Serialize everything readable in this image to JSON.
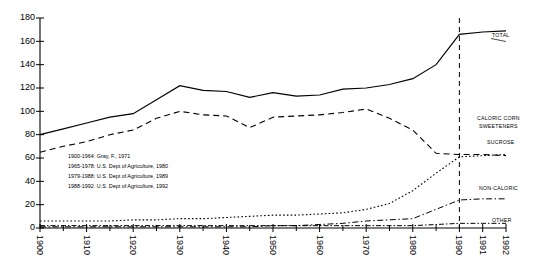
{
  "chart_data": {
    "type": "line",
    "title": "",
    "xlabel": "",
    "ylabel": "",
    "ylim": [
      0,
      180
    ],
    "ytick_step": 20,
    "yticks": [
      0,
      20,
      40,
      60,
      80,
      100,
      120,
      140,
      160,
      180
    ],
    "xticks": [
      1900,
      1910,
      1920,
      1930,
      1940,
      1950,
      1960,
      1970,
      1980,
      1990,
      1991,
      1992
    ],
    "xtick_labels": [
      "1900",
      "1910",
      "1920",
      "1930",
      "1940",
      "1950",
      "1960",
      "1970",
      "1980",
      "1990",
      "1991",
      "1992"
    ],
    "grid": false,
    "legend": "inline-right-labels",
    "x": [
      1900,
      1905,
      1910,
      1915,
      1920,
      1925,
      1930,
      1935,
      1940,
      1945,
      1950,
      1955,
      1960,
      1965,
      1970,
      1975,
      1980,
      1985,
      1990,
      1991,
      1992
    ],
    "series": [
      {
        "name": "TOTAL",
        "style": "solid",
        "values": [
          80,
          85,
          90,
          95,
          98,
          110,
          122,
          118,
          117,
          112,
          116,
          113,
          114,
          119,
          120,
          123,
          128,
          140,
          166,
          168,
          169
        ]
      },
      {
        "name": "CALORIC CORN SWEETENERS",
        "style": "dotted",
        "values": [
          6,
          6,
          6,
          6,
          7,
          7,
          8,
          8,
          9,
          10,
          11,
          11,
          12,
          13,
          16,
          21,
          32,
          47,
          61,
          62,
          63
        ]
      },
      {
        "name": "SUCROSE",
        "style": "dashed",
        "values": [
          65,
          70,
          74,
          80,
          84,
          94,
          100,
          97,
          96,
          86,
          95,
          96,
          97,
          99,
          102,
          94,
          84,
          64,
          63,
          63,
          62
        ]
      },
      {
        "name": "NON-CALORIC",
        "style": "dashdot",
        "values": [
          1,
          1,
          1,
          1,
          1,
          1,
          1,
          1,
          1,
          1,
          2,
          2,
          3,
          4,
          6,
          7,
          8,
          16,
          24,
          25,
          25
        ]
      },
      {
        "name": "OTHER",
        "style": "dashdot-low",
        "values": [
          2,
          2,
          2,
          2,
          2,
          2,
          2,
          2,
          2,
          2,
          2,
          2,
          2,
          2,
          2,
          2,
          2,
          3,
          4,
          4,
          4
        ]
      }
    ],
    "divider_x": 1990,
    "divider_style": "dashed-vertical",
    "annotations": [
      "1900-1964:  Gray, F., 1971",
      "1965-1978:  U.S. Dept of Agriculture, 1980",
      "1979-1988:  U.S. Dept of Agriculture, 1989",
      "1988-1992:  U.S. Dept of Agriculture, 1992"
    ]
  },
  "labels": {
    "total": "TOTAL",
    "caloric_corn_line1": "CALORIC CORN",
    "caloric_corn_line2": "SWEETENERS",
    "sucrose": "SUCROSE",
    "non_caloric": "NON-CALORIC",
    "other": "OTHER"
  },
  "sources": {
    "line1": "1900-1964:  Gray, F., 1971",
    "line2": "1965-1978:  U.S. Dept of Agriculture, 1980",
    "line3": "1979-1988:  U.S. Dept of Agriculture, 1989",
    "line4": "1988-1992:  U.S. Dept of Agriculture, 1992"
  },
  "yticks": {
    "t0": "0",
    "t20": "20",
    "t40": "40",
    "t60": "60",
    "t80": "80",
    "t100": "100",
    "t120": "120",
    "t140": "140",
    "t160": "160",
    "t180": "180"
  },
  "xticks": {
    "x1900": "1900",
    "x1910": "1910",
    "x1920": "1920",
    "x1930": "1930",
    "x1940": "1940",
    "x1950": "1950",
    "x1960": "1960",
    "x1970": "1970",
    "x1980": "1980",
    "x1990": "1990",
    "x1991": "1991",
    "x1992": "1992"
  },
  "colors": {
    "ink": "#000000",
    "background": "#ffffff"
  }
}
